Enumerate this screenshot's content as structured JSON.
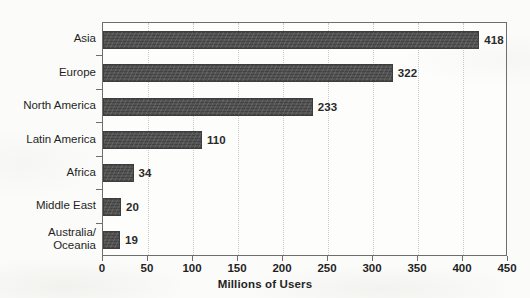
{
  "chart_data": {
    "type": "bar",
    "orientation": "horizontal",
    "title": "",
    "subtitle": "",
    "xlabel": "Millions of Users",
    "ylabel": "",
    "categories": [
      "Asia",
      "Europe",
      "North America",
      "Latin America",
      "Africa",
      "Middle East",
      "Australia/\nOceania"
    ],
    "values": [
      418,
      322,
      233,
      110,
      34,
      20,
      19
    ],
    "value_labels": [
      "418",
      "322",
      "233",
      "110",
      "34",
      "20",
      "19"
    ],
    "xlim": [
      0,
      450
    ],
    "xticks": [
      0,
      50,
      100,
      150,
      200,
      250,
      300,
      350,
      400,
      450
    ],
    "xtick_labels": [
      "0",
      "50",
      "100",
      "150",
      "200",
      "250",
      "300",
      "350",
      "400",
      "450"
    ],
    "grid": "vertical-dotted",
    "legend": "none",
    "bar_color": "#4a4a4a",
    "axis_color": "#6e6e6e",
    "gridline_color": "#c9c9c4",
    "background_color": "#fbfbf9"
  }
}
